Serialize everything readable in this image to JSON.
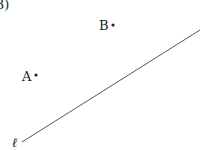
{
  "problem_label": "3)",
  "points": [
    {
      "name": "A",
      "label": "A",
      "x": 36,
      "y": 75
    },
    {
      "name": "B",
      "label": "B",
      "x": 113,
      "y": 25
    }
  ],
  "line": {
    "label": "ℓ",
    "x1": 22,
    "y1": 142,
    "x2": 200,
    "y2": 30
  },
  "colors": {
    "ink": "#222222",
    "line": "#444444"
  }
}
